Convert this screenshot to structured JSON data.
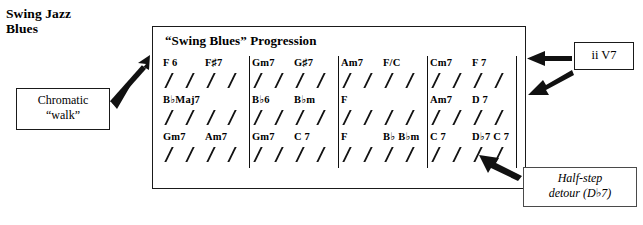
{
  "page_title": {
    "line1": "Swing Jazz",
    "line2": "Blues"
  },
  "chart": {
    "heading": "“Swing Blues” Progression",
    "rows": [
      {
        "measures": [
          {
            "chords": [
              {
                "slot": 0,
                "text": "F 6"
              },
              {
                "slot": 2,
                "text": "F♯7"
              }
            ]
          },
          {
            "chords": [
              {
                "slot": 0,
                "text": "Gm7"
              },
              {
                "slot": 2,
                "text": "G♯7"
              }
            ]
          },
          {
            "chords": [
              {
                "slot": 0,
                "text": "Am7"
              },
              {
                "slot": 2,
                "text": "F/C"
              }
            ]
          },
          {
            "chords": [
              {
                "slot": 0,
                "text": "Cm7"
              },
              {
                "slot": 2,
                "text": "F 7"
              }
            ]
          }
        ]
      },
      {
        "measures": [
          {
            "chords": [
              {
                "slot": 0,
                "text": "B♭Maj7"
              }
            ]
          },
          {
            "chords": [
              {
                "slot": 0,
                "text": "B♭6"
              },
              {
                "slot": 2,
                "text": "B♭m"
              }
            ]
          },
          {
            "chords": [
              {
                "slot": 0,
                "text": "F"
              }
            ]
          },
          {
            "chords": [
              {
                "slot": 0,
                "text": "Am7"
              },
              {
                "slot": 2,
                "text": "D 7"
              }
            ]
          }
        ]
      },
      {
        "measures": [
          {
            "chords": [
              {
                "slot": 0,
                "text": "Gm7"
              },
              {
                "slot": 2,
                "text": "Am7"
              }
            ]
          },
          {
            "chords": [
              {
                "slot": 0,
                "text": "Gm7"
              },
              {
                "slot": 2,
                "text": "C 7"
              }
            ]
          },
          {
            "chords": [
              {
                "slot": 0,
                "text": "F"
              },
              {
                "slot": 2,
                "text": "B♭ B♭m"
              }
            ]
          },
          {
            "chords": [
              {
                "slot": 0,
                "text": "C 7"
              },
              {
                "slot": 2,
                "text": "D♭7 C 7"
              }
            ]
          }
        ]
      }
    ],
    "slashes_per_measure": 4
  },
  "callouts": {
    "chromatic": {
      "line1": "Chromatic",
      "line2": "“walk”"
    },
    "ii_v7": {
      "label": "ii V7"
    },
    "half_step": {
      "line1": "Half-step",
      "line2": "detour (D♭7)"
    }
  },
  "colors": {
    "ink": "#111111",
    "box_border": "#1a1a1a",
    "thin_border": "#4a4a4a",
    "background": "#ffffff"
  }
}
